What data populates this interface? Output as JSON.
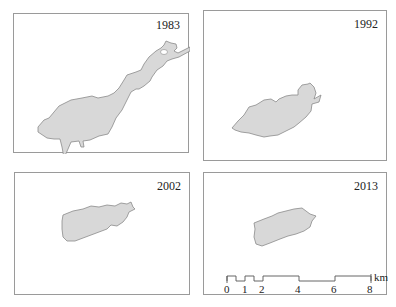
{
  "panels": [
    {
      "year": "1983"
    },
    {
      "year": "1992"
    },
    {
      "year": "2002"
    },
    {
      "year": "2013"
    }
  ],
  "scale_bar": {
    "unit": "km",
    "ticks": [
      "0",
      "1",
      "2",
      "4",
      "6",
      "8"
    ]
  },
  "colors": {
    "lake_fill": "#d8d8d8",
    "lake_outline": "#8a8a8a",
    "frame": "#9a9a9a"
  }
}
